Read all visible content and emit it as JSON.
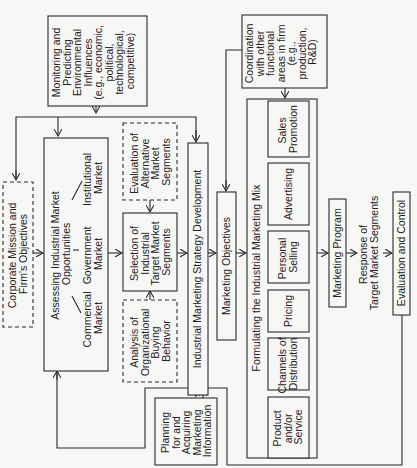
{
  "colors": {
    "background": "#f7f7f5",
    "stroke": "#2a2a2a",
    "text": "#222222"
  },
  "nodes": {
    "monitoring": {
      "lines": [
        "Monitoring and",
        "Predicting",
        "Environmental",
        "Influences",
        "(e.g., economic,",
        "political,",
        "technological,",
        "competitive)"
      ]
    },
    "coordination": {
      "lines": [
        "Coordination",
        "with other",
        "functional",
        "areas in firm",
        "(e.g.,",
        "production,",
        "R&D)"
      ]
    },
    "corporate_mission": {
      "lines": [
        "Corporate Mission and",
        "Firm's Objectives"
      ]
    },
    "assessing": {
      "title_lines": [
        "Assessing Industrial Market",
        "Opportunities"
      ],
      "markets": {
        "commercial": [
          "Commercial",
          "Market"
        ],
        "government": [
          "Government",
          "Market"
        ],
        "institutional": [
          "Institutional",
          "Market"
        ]
      }
    },
    "evaluation_segments": {
      "lines": [
        "Evaluation of",
        "Alternative",
        "Market",
        "Segments"
      ]
    },
    "selection": {
      "lines": [
        "Selection of",
        "Industrial",
        "Target Market",
        "Segments"
      ]
    },
    "analysis": {
      "lines": [
        "Analysis of",
        "Organizational",
        "Buying",
        "Behavior"
      ]
    },
    "strategy_dev": {
      "label": "Industrial Marketing Strategy Development"
    },
    "planning": {
      "lines": [
        "Planning",
        "for and",
        "Acquiring",
        "Marketing",
        "Information"
      ]
    },
    "marketing_objectives": {
      "label": "Marketing Objectives"
    },
    "marketing_mix": {
      "title": "Formulating the Industrial Marketing Mix",
      "elements": [
        {
          "lines": [
            "Product",
            "and/or",
            "Service"
          ]
        },
        {
          "lines": [
            "Channels of",
            "Distribution"
          ]
        },
        {
          "lines": [
            "Pricing"
          ]
        },
        {
          "lines": [
            "Personal",
            "Selling"
          ]
        },
        {
          "lines": [
            "Advertising"
          ]
        },
        {
          "lines": [
            "Sales",
            "Promotion"
          ]
        }
      ]
    },
    "marketing_program": {
      "label": "Marketing Program"
    },
    "response": {
      "lines": [
        "Response of",
        "Target Market Segments"
      ]
    },
    "evaluation_control": {
      "label": "Evaluation and Control"
    }
  }
}
